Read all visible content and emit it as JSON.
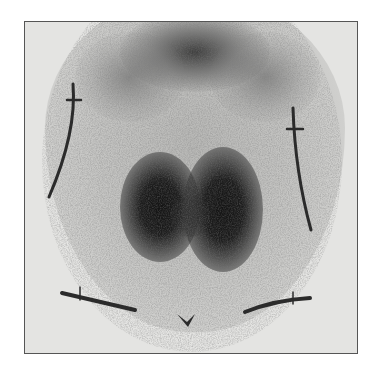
{
  "image": {
    "description": "Nuclear medicine thyroid scintigraphy, anterior view, with anatomical lead markers",
    "colors": {
      "background": "#ffffff",
      "film": "#e4e4e2",
      "activity": "#1a1a1a",
      "marker": "#2b2b2b",
      "border": "#555555"
    }
  },
  "regions": [
    {
      "name": "thyroid-left-lobe",
      "intensity": "high"
    },
    {
      "name": "thyroid-right-lobe",
      "intensity": "high"
    },
    {
      "name": "salivary-upper-activity",
      "intensity": "medium"
    },
    {
      "name": "sternal-notch-marker",
      "shape": "v-mark"
    },
    {
      "name": "left-jaw-marker",
      "shape": "line-with-tick"
    },
    {
      "name": "right-jaw-marker",
      "shape": "line-with-tick"
    },
    {
      "name": "left-clavicle-marker",
      "shape": "line-with-tick"
    },
    {
      "name": "right-clavicle-marker",
      "shape": "line-with-tick"
    }
  ]
}
